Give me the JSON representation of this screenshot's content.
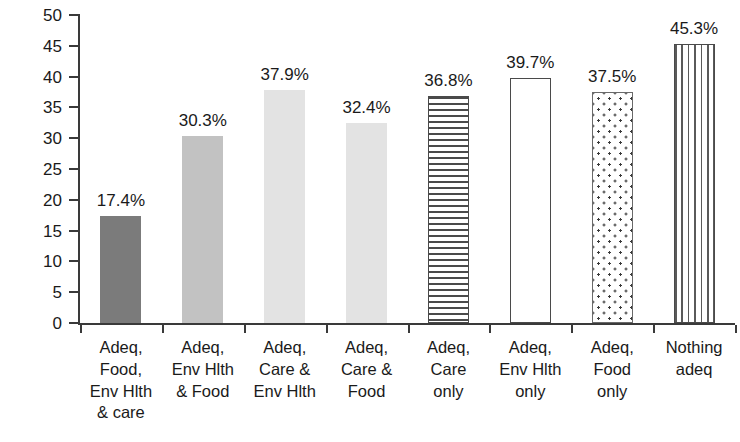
{
  "chart_data": {
    "type": "bar",
    "title": "",
    "xlabel": "",
    "ylabel": "Average stunted",
    "ylim": [
      0,
      50
    ],
    "ytick_step": 5,
    "yticks": [
      "50",
      "45",
      "40",
      "35",
      "30",
      "25",
      "20",
      "15",
      "10",
      "5",
      "0"
    ],
    "grid": false,
    "legend": "none",
    "categories": [
      "Adeq,\nFood,\nEnv Hlth\n& care",
      "Adeq,\nEnv Hlth\n& Food",
      "Adeq,\nCare &\nEnv Hlth",
      "Adeq,\nCare &\nFood",
      "Adeq,\nCare\nonly",
      "Adeq,\nEnv Hlth\nonly",
      "Adeq,\nFood\nonly",
      "Nothing\nadeq"
    ],
    "values": [
      17.4,
      30.3,
      37.9,
      32.4,
      36.8,
      39.7,
      37.5,
      45.3
    ],
    "value_labels": [
      "17.4%",
      "30.3%",
      "37.9%",
      "32.4%",
      "36.8%",
      "39.7%",
      "37.5%",
      "45.3%"
    ],
    "bar_styles": [
      "solid-dark-gray",
      "solid-medium-gray",
      "solid-light-gray",
      "solid-light-gray",
      "horizontal-stripes",
      "open-white-outline",
      "dotted",
      "vertical-stripes"
    ],
    "colors": {
      "solid_dark_gray": "#7b7b7b",
      "solid_medium_gray": "#c2c2c2",
      "solid_light_gray": "#e3e3e3",
      "outline": "#4a4a4a",
      "axis": "#3a3a3a",
      "text": "#1a1a1a",
      "background": "#ffffff"
    }
  }
}
